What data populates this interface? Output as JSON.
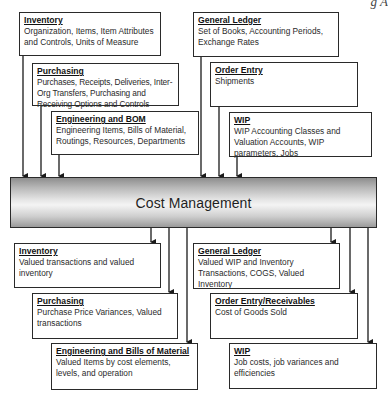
{
  "caption_fragment": "g  A",
  "center": {
    "label": "Cost Management"
  },
  "inputs": [
    {
      "id": "inventory",
      "title": "Inventory",
      "desc": "Organization, Items, Item Attributes and Controls, Units of Measure"
    },
    {
      "id": "purchasing",
      "title": "Purchasing",
      "desc": "Purchases, Receipts, Deliveries, Inter-Org Transfers, Purchasing and Receiving Options and Controls"
    },
    {
      "id": "engineering-bom",
      "title": "Engineering and BOM",
      "desc": "Engineering Items, Bills of Material, Routings, Resources, Departments"
    },
    {
      "id": "general-ledger",
      "title": "General Ledger",
      "desc": "Set of Books, Accounting Periods, Exchange Rates"
    },
    {
      "id": "order-entry",
      "title": "Order Entry",
      "desc": "Shipments"
    },
    {
      "id": "wip",
      "title": "WIP",
      "desc": "WIP Accounting Classes and Valuation Accounts, WIP parameters, Jobs"
    }
  ],
  "outputs": [
    {
      "id": "inventory",
      "title": "Inventory",
      "desc": "Valued transactions and valued inventory"
    },
    {
      "id": "purchasing",
      "title": "Purchasing",
      "desc": "Purchase Price Variances, Valued transactions"
    },
    {
      "id": "engineering-bills-of-material",
      "title": "Engineering and Bills of Material",
      "desc": "Valued Items by cost elements, levels, and operation"
    },
    {
      "id": "general-ledger",
      "title": "General Ledger",
      "desc": "Valued WIP and Inventory Transactions, COGS, Valued Inventory"
    },
    {
      "id": "order-entry-receivables",
      "title": "Order Entry/Receivables",
      "desc": "Cost of Goods Sold"
    },
    {
      "id": "wip",
      "title": "WIP",
      "desc": "Job costs, job variances and efficiencies"
    }
  ],
  "colors": {
    "border": "#2a2a2a",
    "text": "#1a1a1a",
    "gradient_dark": "#8e8e8e",
    "gradient_light": "#f4f4f4"
  }
}
